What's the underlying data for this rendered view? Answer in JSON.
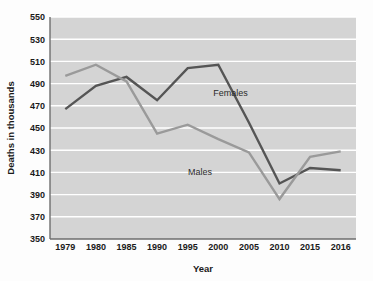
{
  "chart_data": {
    "type": "line",
    "title": "",
    "xlabel": "Year",
    "ylabel": "Deaths in thousands",
    "categories": [
      "1979",
      "1980",
      "1985",
      "1990",
      "1995",
      "2000",
      "2005",
      "2010",
      "2015",
      "2016"
    ],
    "ylim": [
      350,
      550
    ],
    "yticks": [
      350,
      370,
      390,
      410,
      430,
      450,
      470,
      490,
      510,
      530,
      550
    ],
    "grid": true,
    "legend_position": "inline-annotation",
    "series": [
      {
        "name": "Females",
        "color": "#555555",
        "values": [
          467,
          488,
          496,
          475,
          504,
          507,
          455,
          400,
          414,
          412
        ]
      },
      {
        "name": "Males",
        "color": "#9a9a9a",
        "values": [
          497,
          507,
          492,
          445,
          453,
          440,
          428,
          386,
          424,
          429
        ]
      }
    ],
    "annotations": [
      {
        "text": "Females",
        "x_value": "2002",
        "y_value": 479
      },
      {
        "text": "Males",
        "x_value": "1997",
        "y_value": 408
      }
    ]
  },
  "axes": {
    "y_tick_labels": [
      "550",
      "530",
      "510",
      "490",
      "470",
      "450",
      "430",
      "410",
      "390",
      "370",
      "350"
    ],
    "x_tick_labels": [
      "1979",
      "1980",
      "1985",
      "1990",
      "1995",
      "2000",
      "2005",
      "2010",
      "2015",
      "2016"
    ],
    "y_axis_title": "Deaths in thousands",
    "x_axis_title": "Year"
  },
  "colors": {
    "plot_background": "#d4d4d4",
    "gridline": "#ffffff",
    "axis": "#6e6e6e",
    "females_line": "#555555",
    "males_line": "#9a9a9a",
    "text": "#1a1a1a"
  }
}
